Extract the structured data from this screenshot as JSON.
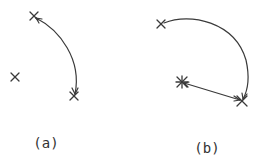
{
  "colors": {
    "background": "#ffffff",
    "ink": "#3a3a3a"
  },
  "panels": [
    {
      "id": "a",
      "label": "(a)",
      "markers": [
        {
          "type": "cross",
          "x": 34,
          "y": 16
        },
        {
          "type": "cross",
          "x": 74,
          "y": 96
        },
        {
          "type": "cross",
          "x": 15,
          "y": 77
        }
      ],
      "arc": {
        "from": [
          34,
          16
        ],
        "to": [
          74,
          96
        ],
        "arrowheads": "both"
      }
    },
    {
      "id": "b",
      "label": "(b)",
      "markers": [
        {
          "type": "cross",
          "x": 161,
          "y": 24
        },
        {
          "type": "star",
          "x": 182,
          "y": 82
        },
        {
          "type": "cross",
          "x": 242,
          "y": 101
        }
      ],
      "arc": {
        "from": [
          161,
          24
        ],
        "to": [
          242,
          101
        ],
        "arrowheads": "end"
      },
      "vector": {
        "from": [
          182,
          82
        ],
        "to": [
          242,
          101
        ],
        "arrowheads": "both"
      }
    }
  ]
}
